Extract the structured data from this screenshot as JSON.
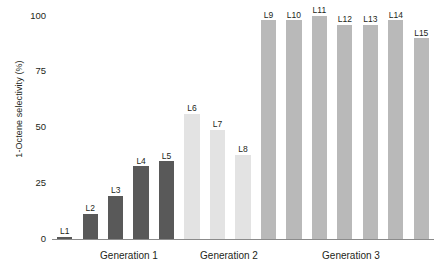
{
  "chart_data": {
    "type": "bar",
    "title": "",
    "xlabel": "",
    "ylabel": "1-Octene selectivity (%)",
    "ylim": [
      0,
      100
    ],
    "yticks": [
      0,
      25,
      50,
      75,
      100
    ],
    "grid": false,
    "legend": "none",
    "categories": [
      "L1",
      "L2",
      "L3",
      "L4",
      "L5",
      "L6",
      "L7",
      "L8",
      "L9",
      "L10",
      "L11",
      "L12",
      "L13",
      "L14",
      "L15"
    ],
    "values": [
      1,
      11,
      19,
      32,
      34,
      55,
      48,
      37,
      96,
      96,
      98,
      94,
      94,
      96,
      88
    ],
    "bar_labels": [
      "L1",
      "L2",
      "L3",
      "L4",
      "L5",
      "L6",
      "L7",
      "L8",
      "L9",
      "L10",
      "L11",
      "L12",
      "L13",
      "L14",
      "L15"
    ],
    "group_labels": [
      "Generation 1",
      "Generation 2",
      "Generation 3"
    ],
    "groups": [
      {
        "name": "Generation 1",
        "categories": [
          "L1",
          "L2",
          "L3",
          "L4",
          "L5"
        ],
        "values": [
          1,
          11,
          19,
          32,
          34
        ],
        "color": "#595959"
      },
      {
        "name": "Generation 2",
        "categories": [
          "L6",
          "L7",
          "L8"
        ],
        "values": [
          55,
          48,
          37
        ],
        "color": "#e3e3e3"
      },
      {
        "name": "Generation 3",
        "categories": [
          "L9",
          "L10",
          "L11",
          "L12",
          "L13",
          "L14",
          "L15"
        ],
        "values": [
          96,
          96,
          98,
          94,
          94,
          96,
          88
        ],
        "color": "#b9b9b9"
      }
    ],
    "colors": {
      "generation_1": "#595959",
      "generation_2": "#e3e3e3",
      "generation_3": "#b9b9b9",
      "axis": "#8b8b8b",
      "text": "#231f20",
      "background": "#ffffff"
    }
  },
  "axis": {
    "tick_0": "0",
    "tick_25": "25",
    "tick_50": "50",
    "tick_75": "75",
    "tick_100": "100"
  },
  "generations": {
    "g1": "Generation 1",
    "g2": "Generation 2",
    "g3": "Generation 3"
  }
}
